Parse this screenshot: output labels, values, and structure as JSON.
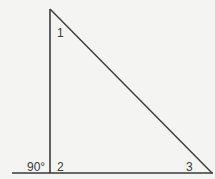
{
  "diagram": {
    "type": "right-triangle",
    "labels": {
      "angle1": "1",
      "angle2": "2",
      "angle3": "3",
      "right_angle": "90°"
    },
    "colors": {
      "background": "#f4f4f2",
      "line": "#3a3a3a"
    }
  }
}
